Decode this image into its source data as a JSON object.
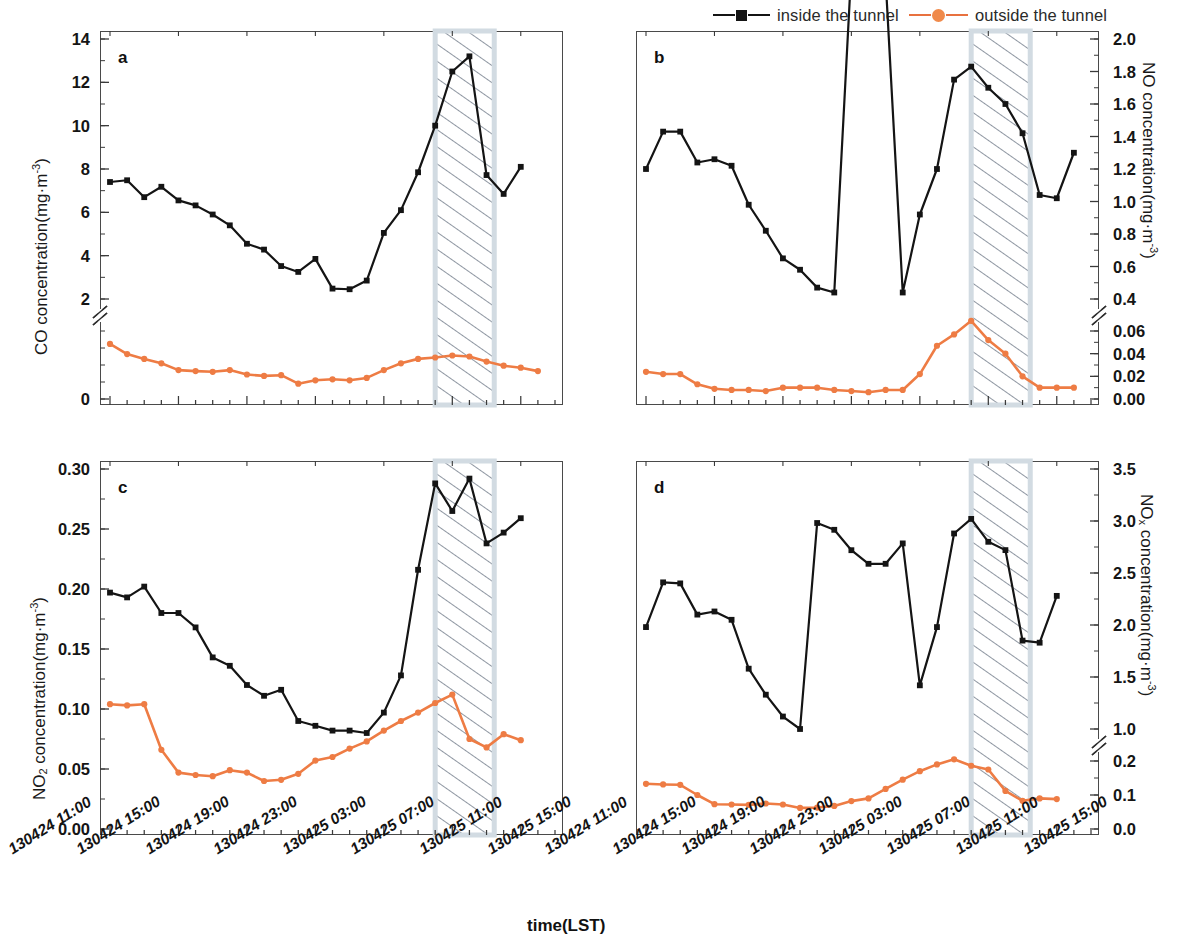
{
  "figure": {
    "xaxis_title": "time(LST)",
    "legend": [
      {
        "name": "inside the tunnel",
        "marker": "square",
        "color": "#141414"
      },
      {
        "name": "outside the tunnel",
        "marker": "circle",
        "color": "#F08A4B"
      }
    ],
    "xtick_labels": [
      "130424 11:00",
      "130424 15:00",
      "130424 19:00",
      "130424 23:00",
      "130425 03:00",
      "130425 07:00",
      "130425 11:00",
      "130425 15:00"
    ]
  },
  "chart_data": [
    {
      "type": "line",
      "panel": "a",
      "title": "",
      "xlabel": "time(LST)",
      "ylabel": "CO concentration(mg·m⁻³)",
      "ylabel_base": "CO concentration(mg·m",
      "ylabel_sup": "-3",
      "grid": false,
      "legend_position": "top-center (shared)",
      "axis_break": true,
      "ylim_upper": [
        2,
        14
      ],
      "ylim_lower": [
        0,
        2
      ],
      "ytick_labels_upper": [
        "2",
        "4",
        "6",
        "8",
        "10",
        "12",
        "14"
      ],
      "ytick_labels_lower": [
        "0"
      ],
      "yticks_upper": [
        2,
        4,
        6,
        8,
        10,
        12,
        14
      ],
      "yticks_lower": [
        0
      ],
      "shaded_region": {
        "label": "tunnel closure",
        "x_start": "130425 07:00",
        "x_end": "130425 10:00",
        "hatch": "diagonal"
      },
      "x": [
        "130424 12:00",
        "130424 13:00",
        "130424 14:00",
        "130424 15:00",
        "130424 16:00",
        "130424 17:00",
        "130424 18:00",
        "130424 19:00",
        "130424 20:00",
        "130424 21:00",
        "130424 22:00",
        "130424 23:00",
        "130425 00:00",
        "130425 01:00",
        "130425 02:00",
        "130425 03:00",
        "130425 04:00",
        "130425 05:00",
        "130425 06:00",
        "130425 07:00",
        "130425 08:00",
        "130425 09:00",
        "130425 10:00",
        "130425 11:00",
        "130425 12:00",
        "130425 13:00",
        "130425 14:00"
      ],
      "series": [
        {
          "name": "inside the tunnel",
          "color": "#141414",
          "marker": "square",
          "values": [
            7.4,
            7.48,
            6.7,
            7.18,
            6.55,
            6.32,
            5.9,
            5.4,
            4.55,
            4.28,
            3.52,
            3.25,
            3.85,
            2.48,
            2.45,
            2.85,
            5.05,
            6.1,
            7.85,
            10.0,
            12.5,
            13.2,
            7.72,
            6.85,
            8.1,
            null,
            null
          ]
        },
        {
          "name": "outside the tunnel",
          "color": "#F08A4B",
          "marker": "circle",
          "values": [
            1.62,
            1.32,
            1.18,
            1.05,
            0.85,
            0.82,
            0.8,
            0.85,
            0.72,
            0.68,
            0.7,
            0.45,
            0.55,
            0.58,
            0.55,
            0.62,
            0.85,
            1.05,
            1.18,
            1.22,
            1.28,
            1.25,
            1.1,
            0.98,
            0.92,
            0.82,
            null
          ]
        }
      ]
    },
    {
      "type": "line",
      "panel": "b",
      "title": "",
      "xlabel": "time(LST)",
      "ylabel": "NO concentration(mg·m⁻³)",
      "ylabel_base": "NO concentration(mg·m",
      "ylabel_sup": "-3",
      "grid": false,
      "axis_break": true,
      "ylim_upper": [
        0.4,
        2.0
      ],
      "ylim_lower": [
        0.0,
        0.06
      ],
      "ytick_labels_upper": [
        "0.4",
        "0.6",
        "0.8",
        "1.0",
        "1.2",
        "1.4",
        "1.6",
        "1.8",
        "2.0"
      ],
      "ytick_labels_lower": [
        "0.00",
        "0.02",
        "0.04",
        "0.06"
      ],
      "yticks_upper": [
        0.4,
        0.6,
        0.8,
        1.0,
        1.2,
        1.4,
        1.6,
        1.8,
        2.0
      ],
      "yticks_lower": [
        0.0,
        0.02,
        0.04,
        0.06
      ],
      "shaded_region": {
        "label": "tunnel closure",
        "x_start": "130425 07:00",
        "x_end": "130425 10:00",
        "hatch": "diagonal"
      },
      "x": [
        "130424 12:00",
        "130424 13:00",
        "130424 14:00",
        "130424 15:00",
        "130424 16:00",
        "130424 17:00",
        "130424 18:00",
        "130424 19:00",
        "130424 20:00",
        "130424 21:00",
        "130424 22:00",
        "130424 23:00",
        "130425 00:00",
        "130425 01:00",
        "130425 02:00",
        "130425 03:00",
        "130425 04:00",
        "130425 05:00",
        "130425 06:00",
        "130425 07:00",
        "130425 08:00",
        "130425 09:00",
        "130425 10:00",
        "130425 11:00",
        "130425 12:00",
        "130425 13:00",
        "130425 14:00"
      ],
      "series": [
        {
          "name": "inside the tunnel",
          "color": "#141414",
          "marker": "square",
          "values": [
            1.2,
            1.43,
            1.43,
            1.24,
            1.26,
            1.22,
            0.98,
            0.82,
            0.65,
            0.58,
            0.47,
            0.44,
            0.38,
            0.36,
            0.37,
            0.44,
            0.92,
            1.2,
            1.75,
            1.83,
            1.7,
            1.6,
            1.42,
            1.04,
            1.02,
            1.3,
            null
          ]
        },
        {
          "name": "outside the tunnel",
          "color": "#F08A4B",
          "marker": "circle",
          "values": [
            0.024,
            0.022,
            0.022,
            0.013,
            0.009,
            0.008,
            0.008,
            0.007,
            0.01,
            0.01,
            0.01,
            0.008,
            0.007,
            0.006,
            0.008,
            0.008,
            0.022,
            0.047,
            0.057,
            0.069,
            0.052,
            0.04,
            0.02,
            0.01,
            0.01,
            0.01,
            null
          ]
        }
      ]
    },
    {
      "type": "line",
      "panel": "c",
      "title": "",
      "xlabel": "time(LST)",
      "ylabel": "NO2 concentration(mg·m⁻³)",
      "ylabel_base": "NO",
      "ylabel_sub": "2",
      "ylabel_mid": " concentration(mg·m",
      "ylabel_sup": "-3",
      "grid": false,
      "axis_break": false,
      "ylim": [
        0.0,
        0.3
      ],
      "ytick_labels": [
        "0.00",
        "0.05",
        "0.10",
        "0.15",
        "0.20",
        "0.25",
        "0.30"
      ],
      "yticks": [
        0.0,
        0.05,
        0.1,
        0.15,
        0.2,
        0.25,
        0.3
      ],
      "shaded_region": {
        "label": "tunnel closure",
        "x_start": "130425 07:00",
        "x_end": "130425 10:00",
        "hatch": "diagonal"
      },
      "x": [
        "130424 12:00",
        "130424 13:00",
        "130424 14:00",
        "130424 15:00",
        "130424 16:00",
        "130424 17:00",
        "130424 18:00",
        "130424 19:00",
        "130424 20:00",
        "130424 21:00",
        "130424 22:00",
        "130424 23:00",
        "130425 00:00",
        "130425 01:00",
        "130425 02:00",
        "130425 03:00",
        "130425 04:00",
        "130425 05:00",
        "130425 06:00",
        "130425 07:00",
        "130425 08:00",
        "130425 09:00",
        "130425 10:00",
        "130425 11:00",
        "130425 12:00",
        "130425 13:00",
        "130425 14:00"
      ],
      "series": [
        {
          "name": "inside the tunnel",
          "color": "#141414",
          "marker": "square",
          "values": [
            0.197,
            0.193,
            0.202,
            0.18,
            0.18,
            0.168,
            0.143,
            0.136,
            0.12,
            0.111,
            0.116,
            0.09,
            0.086,
            0.082,
            0.082,
            0.08,
            0.097,
            0.128,
            0.216,
            0.288,
            0.265,
            0.292,
            0.238,
            0.247,
            0.259,
            null,
            null
          ]
        },
        {
          "name": "outside the tunnel",
          "color": "#F08A4B",
          "marker": "circle",
          "values": [
            0.104,
            0.103,
            0.104,
            0.066,
            0.047,
            0.045,
            0.044,
            0.049,
            0.047,
            0.04,
            0.041,
            0.046,
            0.057,
            0.06,
            0.067,
            0.073,
            0.082,
            0.09,
            0.097,
            0.105,
            0.112,
            0.075,
            0.068,
            0.079,
            0.074,
            null,
            null
          ]
        }
      ]
    },
    {
      "type": "line",
      "panel": "d",
      "title": "",
      "xlabel": "time(LST)",
      "ylabel": "NOx concentration(mg·m⁻³)",
      "ylabel_base": "NO",
      "ylabel_sub": "x",
      "ylabel_mid": " concentration(mg·m",
      "ylabel_sup": "-3",
      "grid": false,
      "axis_break": true,
      "ylim_upper": [
        1.0,
        3.5
      ],
      "ylim_lower": [
        0.0,
        0.2
      ],
      "ytick_labels_upper": [
        "1.0",
        "1.5",
        "2.0",
        "2.5",
        "3.0",
        "3.5"
      ],
      "ytick_labels_lower": [
        "0.0",
        "0.1",
        "0.2"
      ],
      "yticks_upper": [
        1.0,
        1.5,
        2.0,
        2.5,
        3.0,
        3.5
      ],
      "yticks_lower": [
        0.0,
        0.1,
        0.2
      ],
      "shaded_region": {
        "label": "tunnel closure",
        "x_start": "130425 07:00",
        "x_end": "130425 10:00",
        "hatch": "diagonal"
      },
      "x": [
        "130424 12:00",
        "130424 13:00",
        "130424 14:00",
        "130424 15:00",
        "130424 16:00",
        "130424 17:00",
        "130424 18:00",
        "130424 19:00",
        "130424 20:00",
        "130424 21:00",
        "130424 22:00",
        "130424 23:00",
        "130425 00:00",
        "130425 01:00",
        "130425 02:00",
        "130425 03:00",
        "130425 04:00",
        "130425 05:00",
        "130425 06:00",
        "130425 07:00",
        "130425 08:00",
        "130425 09:00",
        "130425 10:00",
        "130425 11:00",
        "130425 12:00",
        "130425 13:00",
        "130425 14:00"
      ],
      "series": [
        {
          "name": "inside the tunnel",
          "color": "#141414",
          "marker": "square",
          "values": [
            1.98,
            2.41,
            2.4,
            2.1,
            2.13,
            2.05,
            1.58,
            1.33,
            1.12,
            1.0,
            0.9,
            0.88,
            0.82,
            0.78,
            0.78,
            0.84,
            1.42,
            1.98,
            2.88,
            3.02,
            2.8,
            2.72,
            1.85,
            1.83,
            2.28,
            null,
            null
          ]
        },
        {
          "name": "outside the tunnel",
          "color": "#F08A4B",
          "marker": "circle",
          "values": [
            0.133,
            0.131,
            0.13,
            0.1,
            0.073,
            0.072,
            0.071,
            0.075,
            0.072,
            0.062,
            0.063,
            0.068,
            0.082,
            0.09,
            0.118,
            0.145,
            0.17,
            0.19,
            0.205,
            0.186,
            0.175,
            0.112,
            0.083,
            0.09,
            0.088,
            null,
            null
          ]
        }
      ]
    }
  ]
}
